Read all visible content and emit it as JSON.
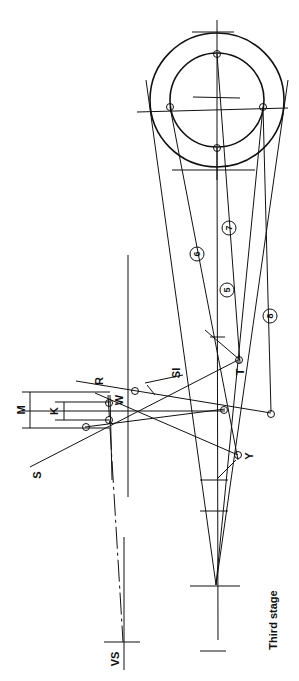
{
  "diagram": {
    "caption": "Third stage",
    "labels": {
      "M": "M",
      "K": "K",
      "R": "R",
      "W": "W",
      "S": "S",
      "SI": "SI",
      "T": "T",
      "Y": "Y",
      "VS": "VS"
    },
    "circled_numbers": [
      "5",
      "6",
      "7",
      "8"
    ]
  }
}
